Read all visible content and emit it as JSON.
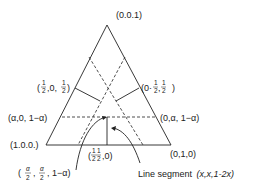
{
  "diagram": {
    "type": "ternary simplex diagram",
    "vertices": {
      "top": "(0,0,1)",
      "left": "(1,0,0)",
      "right": "(0,1,0)"
    },
    "labels": {
      "left_mid": "(1/2, 0, 1/2)",
      "right_mid": "(0, 1/2, 1/2)",
      "left_alpha": "(α, 0, 1−α)",
      "right_alpha": "(0, α, 1−α)",
      "base_mid": "(1/2, 1/2, 0)",
      "alpha_point": "(α/2, α/2, 1−α)",
      "segment": "Line segment (x, x, 1−2x)"
    },
    "text": {
      "top_vertex": "(0.0.1)",
      "left_vertex": "(1.0.0.)",
      "right_vertex": "(0,1,0)",
      "left_alpha_prefix": "(α,0, 1−α)",
      "right_alpha_text": "(0,α, 1−α)",
      "segment_text": "Line segment",
      "segment_formula": "(x,x,1-2x)"
    }
  }
}
